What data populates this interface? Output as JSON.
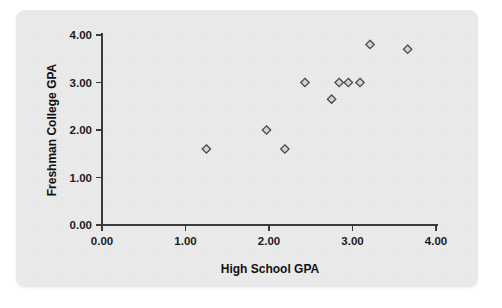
{
  "figure": {
    "panel_background": "#e9e9e9",
    "page_background": "#ffffff",
    "axis_color": "#3b3b3b",
    "marker_stroke": "#4a4a4a",
    "marker_fill": "#d2d2d2"
  },
  "chart_data": {
    "type": "scatter",
    "title": "",
    "xlabel": "High School GPA",
    "ylabel": "Freshman College GPA",
    "xlim": [
      0.0,
      4.0
    ],
    "ylim": [
      0.0,
      4.0
    ],
    "xticks": [
      "0.00",
      "1.00",
      "2.00",
      "3.00",
      "4.00"
    ],
    "yticks": [
      "0.00",
      "1.00",
      "2.00",
      "3.00",
      "4.00"
    ],
    "xtick_values": [
      0.0,
      1.0,
      2.0,
      3.0,
      4.0
    ],
    "ytick_values": [
      0.0,
      1.0,
      2.0,
      3.0,
      4.0
    ],
    "grid": false,
    "legend": false,
    "marker": "open-diamond",
    "series": [
      {
        "name": "Students",
        "points": [
          {
            "x": 1.25,
            "y": 1.6
          },
          {
            "x": 1.97,
            "y": 2.0
          },
          {
            "x": 2.19,
            "y": 1.6
          },
          {
            "x": 2.43,
            "y": 3.0
          },
          {
            "x": 2.75,
            "y": 2.65
          },
          {
            "x": 2.84,
            "y": 3.0
          },
          {
            "x": 2.95,
            "y": 3.0
          },
          {
            "x": 3.09,
            "y": 3.0
          },
          {
            "x": 3.21,
            "y": 3.8
          },
          {
            "x": 3.66,
            "y": 3.7
          }
        ]
      }
    ]
  }
}
